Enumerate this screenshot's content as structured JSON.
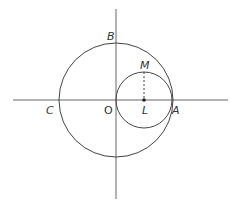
{
  "diagram": {
    "type": "geometry",
    "colors": {
      "stroke": "#555555",
      "axis": "#777777",
      "background": "#ffffff"
    },
    "labels": {
      "B": "B",
      "M": "M",
      "C": "C",
      "O": "O",
      "L": "L",
      "A": "A"
    },
    "geometry": {
      "origin": [
        116,
        100
      ],
      "big_circle": {
        "center": "O",
        "radius": 57
      },
      "small_circle": {
        "center": "L",
        "center_px": [
          144,
          100
        ],
        "radius": 28
      },
      "x_axis": [
        13,
        228
      ],
      "y_axis": [
        9,
        199
      ],
      "dashed_segment": "ML"
    }
  }
}
